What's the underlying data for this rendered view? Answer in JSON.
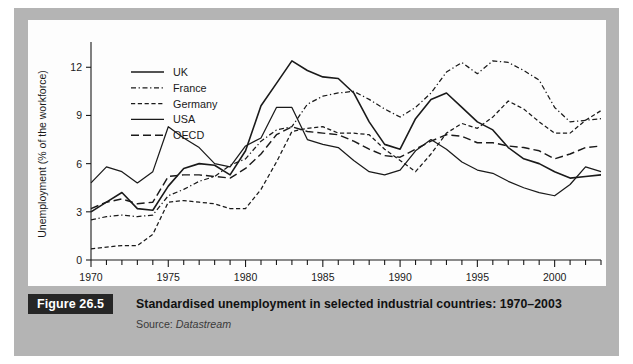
{
  "figure": {
    "tag": "Figure 26.5",
    "title": "Standardised unemployment in selected industrial countries: 1970–2003",
    "source_prefix": "Source: ",
    "source_name": "Datastream"
  },
  "colors": {
    "ink": "#1a1a1a",
    "panel": "#fdfdfd",
    "mount": "#b4b4b4",
    "tag_bg": "#262626",
    "tag_fg": "#ffffff",
    "page": "#ffffff"
  },
  "chart_data": {
    "type": "line",
    "title": "Standardised unemployment in selected industrial countries: 1970–2003",
    "xlabel": "",
    "ylabel": "Unemployment (% of the workforce)",
    "xlim": [
      1970,
      2003
    ],
    "ylim": [
      0,
      13.2
    ],
    "yticks": [
      0,
      3,
      6,
      9,
      12
    ],
    "ytick_labels": [
      "0",
      "3",
      "6",
      "9",
      "12"
    ],
    "xticks_major": [
      1970,
      1975,
      1980,
      1985,
      1990,
      1995,
      2000
    ],
    "xtick_labels": [
      "1970",
      "1975",
      "1980",
      "1985",
      "1990",
      "1995",
      "2000"
    ],
    "xticks_minor_step": 1,
    "grid": false,
    "legend_position": "top-left",
    "x": [
      1970,
      1971,
      1972,
      1973,
      1974,
      1975,
      1976,
      1977,
      1978,
      1979,
      1980,
      1981,
      1982,
      1983,
      1984,
      1985,
      1986,
      1987,
      1988,
      1989,
      1990,
      1991,
      1992,
      1993,
      1994,
      1995,
      1996,
      1997,
      1998,
      1999,
      2000,
      2001,
      2002,
      2003
    ],
    "series": [
      {
        "name": "UK",
        "style": "solid-thick",
        "values": [
          3.0,
          3.6,
          4.2,
          3.2,
          3.1,
          4.6,
          5.7,
          6.0,
          5.9,
          5.3,
          6.8,
          9.6,
          11.0,
          12.4,
          11.8,
          11.4,
          11.3,
          10.4,
          8.6,
          7.2,
          6.9,
          8.8,
          10.0,
          10.4,
          9.5,
          8.6,
          8.1,
          7.0,
          6.3,
          6.0,
          5.5,
          5.1,
          5.2,
          5.3
        ]
      },
      {
        "name": "France",
        "style": "dash-dot",
        "values": [
          2.5,
          2.7,
          2.8,
          2.7,
          2.8,
          4.0,
          4.4,
          4.9,
          5.2,
          5.9,
          6.3,
          7.4,
          8.1,
          8.3,
          9.7,
          10.2,
          10.4,
          10.5,
          10.0,
          9.4,
          8.9,
          9.5,
          10.4,
          11.7,
          12.3,
          11.6,
          12.4,
          12.3,
          11.8,
          11.2,
          9.5,
          8.6,
          8.7,
          8.8
        ]
      },
      {
        "name": "Germany",
        "style": "dash-short",
        "values": [
          0.7,
          0.8,
          0.9,
          0.9,
          1.6,
          3.6,
          3.7,
          3.6,
          3.5,
          3.2,
          3.2,
          4.4,
          6.1,
          8.0,
          8.2,
          8.3,
          7.9,
          7.9,
          7.8,
          6.9,
          6.2,
          5.5,
          6.6,
          7.9,
          8.5,
          8.2,
          8.9,
          9.9,
          9.4,
          8.6,
          7.9,
          7.9,
          8.7,
          9.3
        ]
      },
      {
        "name": "USA",
        "style": "solid-thin",
        "values": [
          4.8,
          5.8,
          5.5,
          4.8,
          5.5,
          8.3,
          7.6,
          7.0,
          6.0,
          5.8,
          7.1,
          7.6,
          9.5,
          9.5,
          7.5,
          7.2,
          7.0,
          6.2,
          5.5,
          5.3,
          5.6,
          6.8,
          7.5,
          6.9,
          6.1,
          5.6,
          5.4,
          4.9,
          4.5,
          4.2,
          4.0,
          4.7,
          5.8,
          5.5
        ]
      },
      {
        "name": "OECD",
        "style": "dash-long",
        "values": [
          3.2,
          3.6,
          3.8,
          3.5,
          3.6,
          5.2,
          5.3,
          5.3,
          5.2,
          5.1,
          5.7,
          6.6,
          7.8,
          8.3,
          8.0,
          7.9,
          7.8,
          7.4,
          6.9,
          6.5,
          6.4,
          6.9,
          7.4,
          7.8,
          7.7,
          7.3,
          7.3,
          7.1,
          7.0,
          6.8,
          6.3,
          6.6,
          7.0,
          7.1
        ]
      }
    ]
  }
}
